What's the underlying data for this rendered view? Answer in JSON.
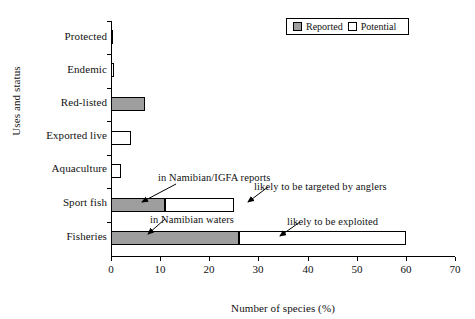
{
  "chart_data": {
    "type": "bar",
    "orientation": "horizontal",
    "stacked": true,
    "title": "",
    "xlabel": "Number of species (%)",
    "ylabel": "Uses and status",
    "xlim": [
      0,
      70
    ],
    "xticks": [
      0,
      10,
      20,
      30,
      40,
      50,
      60,
      70
    ],
    "grid": false,
    "legend": {
      "position": "top-right",
      "boxed": true,
      "entries": [
        {
          "name": "Reported",
          "color": "#9e9e9e"
        },
        {
          "name": "Potential",
          "color": "#ffffff"
        }
      ]
    },
    "categories": [
      "Protected",
      "Endemic",
      "Red-listed",
      "Exported live",
      "Aquaculture",
      "Sport fish",
      "Fisheries"
    ],
    "series": [
      {
        "name": "Reported",
        "color": "#9e9e9e",
        "values": [
          0.5,
          0,
          7,
          0,
          0,
          11,
          26
        ]
      },
      {
        "name": "Potential",
        "color": "#ffffff",
        "values": [
          0,
          0.7,
          0,
          4,
          2,
          14,
          34
        ]
      }
    ],
    "annotations": [
      {
        "id": "in-namibian-igfa-reports",
        "text": "in Namibian/IGFA reports",
        "points_to": "Sport fish reported segment"
      },
      {
        "id": "likely-targeted-by-anglers",
        "text": "likely to be targeted by anglers",
        "points_to": "Sport fish potential segment"
      },
      {
        "id": "in-namibian-waters",
        "text": "in Namibian waters",
        "points_to": "Fisheries reported segment"
      },
      {
        "id": "likely-to-be-exploited",
        "text": "likely to be exploited",
        "points_to": "Fisheries potential segment"
      }
    ]
  },
  "axis": {
    "x_title": "Number of species (%)",
    "y_title": "Uses and status",
    "x_tick_labels": [
      "0",
      "10",
      "20",
      "30",
      "40",
      "50",
      "60",
      "70"
    ]
  },
  "legend": {
    "reported_label": "Reported",
    "potential_label": "Potential"
  },
  "categories": {
    "c0": "Protected",
    "c1": "Endemic",
    "c2": "Red-listed",
    "c3": "Exported live",
    "c4": "Aquaculture",
    "c5": "Sport fish",
    "c6": "Fisheries"
  },
  "annotations": {
    "a0": "in Namibian/IGFA reports",
    "a1": "likely to be targeted by anglers",
    "a2": "in Namibian waters",
    "a3": "likely to be exploited"
  },
  "colors": {
    "reported": "#9e9e9e",
    "potential": "#ffffff",
    "axis": "#000000"
  }
}
